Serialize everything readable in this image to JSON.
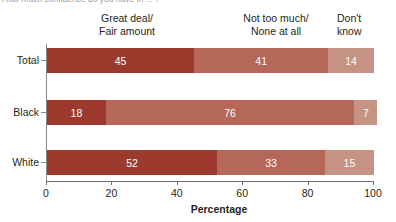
{
  "title_partial": "How much confidence do you have in ... ?",
  "legend_headers": [
    {
      "line1": "Great deal/",
      "line2": "Fair amount"
    },
    {
      "line1": "Not too much/",
      "line2": "None at all"
    },
    {
      "line1": "Don't",
      "line2": "know"
    }
  ],
  "axis": {
    "x_title": "Percentage",
    "x_ticks": [
      "0",
      "20",
      "40",
      "60",
      "80",
      "100"
    ]
  },
  "categories": [
    "Total",
    "Black",
    "White"
  ],
  "colors": {
    "great_deal": "#9b3a2c",
    "not_too_much": "#b5675a",
    "dont_know": "#c49384"
  },
  "chart_data": {
    "type": "bar",
    "orientation": "horizontal",
    "stacked": true,
    "title": "How much confidence do you have in ... ?",
    "xlabel": "Percentage",
    "ylabel": "",
    "xlim": [
      0,
      100
    ],
    "xticks": [
      0,
      20,
      40,
      60,
      80,
      100
    ],
    "grid": false,
    "legend_position": "top",
    "categories": [
      "Total",
      "Black",
      "White"
    ],
    "series": [
      {
        "name": "Great deal/Fair amount",
        "values": [
          45,
          18,
          52
        ],
        "color": "#9b3a2c"
      },
      {
        "name": "Not too much/None at all",
        "values": [
          41,
          76,
          33
        ],
        "color": "#b5675a"
      },
      {
        "name": "Don't know",
        "values": [
          14,
          7,
          15
        ],
        "color": "#c49384"
      }
    ],
    "data_labels": [
      {
        "category": "Total",
        "great_deal": 45,
        "not_too_much": 41,
        "dont_know": 14
      },
      {
        "category": "Black",
        "great_deal": 18,
        "not_too_much": 76,
        "dont_know": 7
      },
      {
        "category": "White",
        "great_deal": 52,
        "not_too_much": 33,
        "dont_know": 15
      }
    ]
  }
}
